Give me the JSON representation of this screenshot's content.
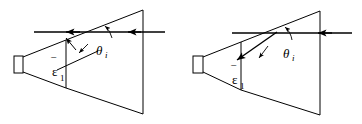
{
  "figure": {
    "width": 362,
    "height": 124,
    "background_color": "#ffffff",
    "line_color": "#000000"
  },
  "panels": [
    {
      "id": "panel-left",
      "name": "left-diagram",
      "description": "Horn antenna pair with normally-incident ray, permittivity vector horizontal",
      "labels": {
        "permittivity": "ε",
        "permittivity_overbar": "‾",
        "permittivity_subscript": "1",
        "angle_symbol": "θ",
        "angle_subscript": "i"
      },
      "geometry": {
        "feed_rect": {
          "x": 14,
          "y": 56,
          "w": 9,
          "h": 17
        },
        "inner_horn": [
          [
            23,
            57
          ],
          [
            66,
            40
          ],
          [
            66,
            88
          ],
          [
            23,
            72
          ]
        ],
        "outer_horn": [
          [
            66,
            40
          ],
          [
            143,
            10
          ],
          [
            143,
            114
          ],
          [
            66,
            88
          ]
        ],
        "inner_aperture_line": {
          "x1": 66,
          "y1": 40,
          "x2": 66,
          "y2": 88
        },
        "outer_aperture_line": {
          "x1": 143,
          "y1": 10,
          "x2": 143,
          "y2": 114
        },
        "ray_horizontal": {
          "x1": 165,
          "y1": 32,
          "x2": 34,
          "y2": 32
        },
        "arrowheads": [
          {
            "x": 67,
            "y": 32,
            "dir": "left"
          },
          {
            "x": 128,
            "y": 32,
            "dir": "left"
          }
        ],
        "permittivity_arrow": {
          "x1": 98,
          "y1": 51,
          "x2": 64,
          "y2": 31
        },
        "angle_arc": {
          "cx": 98,
          "cy": 32,
          "r": 22,
          "start_deg": 185,
          "end_deg": 215
        },
        "label_positions": {
          "permittivity": {
            "x": 57,
            "y": 74
          },
          "angle": {
            "x": 97,
            "y": 53
          }
        }
      }
    },
    {
      "id": "panel-right",
      "name": "right-diagram",
      "description": "Horn antenna pair with obliquely-incident ray, permittivity vector tilted",
      "labels": {
        "permittivity": "ε",
        "permittivity_overbar": "‾",
        "permittivity_subscript": "1",
        "angle_symbol": "θ",
        "angle_subscript": "i"
      },
      "geometry": {
        "feed_rect": {
          "x": 193,
          "y": 56,
          "w": 10,
          "h": 17
        },
        "inner_horn": [
          [
            203,
            57
          ],
          [
            241,
            42
          ],
          [
            241,
            90
          ],
          [
            203,
            72
          ]
        ],
        "outer_horn": [
          [
            241,
            42
          ],
          [
            320,
            11
          ],
          [
            320,
            115
          ],
          [
            241,
            90
          ]
        ],
        "inner_aperture_line": {
          "x1": 241,
          "y1": 42,
          "x2": 241,
          "y2": 90
        },
        "outer_aperture_line": {
          "x1": 320,
          "y1": 11,
          "x2": 320,
          "y2": 115
        },
        "ray_horizontal": {
          "x1": 352,
          "y1": 33,
          "x2": 232,
          "y2": 33
        },
        "arrowheads": [
          {
            "x": 318,
            "y": 33,
            "dir": "left"
          }
        ],
        "permittivity_arrow": {
          "x1": 277,
          "y1": 32,
          "x2": 235,
          "y2": 62
        },
        "angle_arc": {
          "cx": 277,
          "cy": 33,
          "r": 22,
          "start_deg": 185,
          "end_deg": 222
        },
        "label_positions": {
          "permittivity": {
            "x": 236,
            "y": 82
          },
          "angle": {
            "x": 285,
            "y": 56
          }
        }
      }
    }
  ]
}
